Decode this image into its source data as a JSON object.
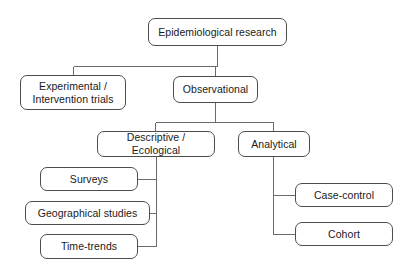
{
  "diagram": {
    "type": "hierarchy-flowchart",
    "canvas": {
      "width": 408,
      "height": 273
    },
    "style": {
      "background": "#ffffff",
      "box_border_color": "#4d4d4d",
      "box_fill": "#ffffff",
      "connector_color": "#6b6b6b",
      "text_color": "#1a1a1a"
    },
    "nodes": [
      {
        "id": "root",
        "label": "Epidemiological research",
        "x": 148,
        "y": 18,
        "w": 139,
        "h": 28,
        "level": 0
      },
      {
        "id": "experimental",
        "label": "Experimental /\nIntervention trials",
        "x": 20,
        "y": 75,
        "w": 106,
        "h": 35,
        "level": 1
      },
      {
        "id": "observational",
        "label": "Observational",
        "x": 173,
        "y": 76,
        "w": 85,
        "h": 27,
        "level": 1
      },
      {
        "id": "descriptive",
        "label": "Descriptive / Ecological",
        "x": 97,
        "y": 131,
        "w": 118,
        "h": 26,
        "level": 2
      },
      {
        "id": "analytical",
        "label": "Analytical",
        "x": 238,
        "y": 131,
        "w": 72,
        "h": 26,
        "level": 2
      },
      {
        "id": "surveys",
        "label": "Surveys",
        "x": 40,
        "y": 167,
        "w": 98,
        "h": 24,
        "level": 3
      },
      {
        "id": "geographical-studies",
        "label": "Geographical studies",
        "x": 25,
        "y": 201,
        "w": 125,
        "h": 24,
        "level": 3
      },
      {
        "id": "time-trends",
        "label": "Time-trends",
        "x": 40,
        "y": 234,
        "w": 98,
        "h": 25,
        "level": 3
      },
      {
        "id": "case-control",
        "label": "Case-control",
        "x": 295,
        "y": 183,
        "w": 98,
        "h": 24,
        "level": 3
      },
      {
        "id": "cohort",
        "label": "Cohort",
        "x": 295,
        "y": 222,
        "w": 98,
        "h": 24,
        "level": 3
      }
    ],
    "edges": [
      {
        "from": "root",
        "to": "experimental"
      },
      {
        "from": "root",
        "to": "observational"
      },
      {
        "from": "observational",
        "to": "descriptive"
      },
      {
        "from": "observational",
        "to": "analytical"
      },
      {
        "from": "descriptive",
        "to": "surveys"
      },
      {
        "from": "descriptive",
        "to": "geographical-studies"
      },
      {
        "from": "descriptive",
        "to": "time-trends"
      },
      {
        "from": "analytical",
        "to": "case-control"
      },
      {
        "from": "analytical",
        "to": "cohort"
      }
    ]
  }
}
